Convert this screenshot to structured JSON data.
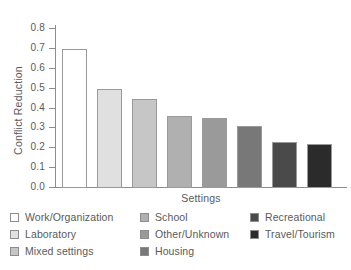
{
  "chart_data": {
    "type": "bar",
    "title": "",
    "xlabel": "Settings",
    "ylabel": "Conflict Reduction",
    "ylim": [
      0.0,
      0.8
    ],
    "yticks": [
      "0.0",
      "0.1",
      "0.2",
      "0.3",
      "0.4",
      "0.5",
      "0.6",
      "0.7",
      "0.8"
    ],
    "ytick_values": [
      0.0,
      0.1,
      0.2,
      0.3,
      0.4,
      0.5,
      0.6,
      0.7,
      0.8
    ],
    "grid": false,
    "legend_position": "below-axes",
    "categories": [
      "Work/Organization",
      "Laboratory",
      "Mixed settings",
      "School",
      "Other/Unknown",
      "Housing",
      "Recreational",
      "Travel/Tourism"
    ],
    "values": [
      0.7,
      0.5,
      0.45,
      0.36,
      0.35,
      0.31,
      0.23,
      0.22
    ],
    "colors": [
      "#ffffff",
      "#e0e0e0",
      "#c6c6c6",
      "#b0b0b0",
      "#9a9a9a",
      "#787878",
      "#4a4a4a",
      "#2b2b2b"
    ]
  },
  "legend": {
    "columns": [
      {
        "items": [
          {
            "label": "Work/Organization",
            "color": "#ffffff"
          },
          {
            "label": "Laboratory",
            "color": "#e0e0e0"
          },
          {
            "label": "Mixed settings",
            "color": "#c6c6c6"
          }
        ]
      },
      {
        "items": [
          {
            "label": "School",
            "color": "#b0b0b0"
          },
          {
            "label": "Other/Unknown",
            "color": "#9a9a9a"
          },
          {
            "label": "Housing",
            "color": "#787878"
          }
        ]
      },
      {
        "items": [
          {
            "label": "Recreational",
            "color": "#4a4a4a"
          },
          {
            "label": "Travel/Tourism",
            "color": "#2b2b2b"
          }
        ]
      }
    ]
  }
}
